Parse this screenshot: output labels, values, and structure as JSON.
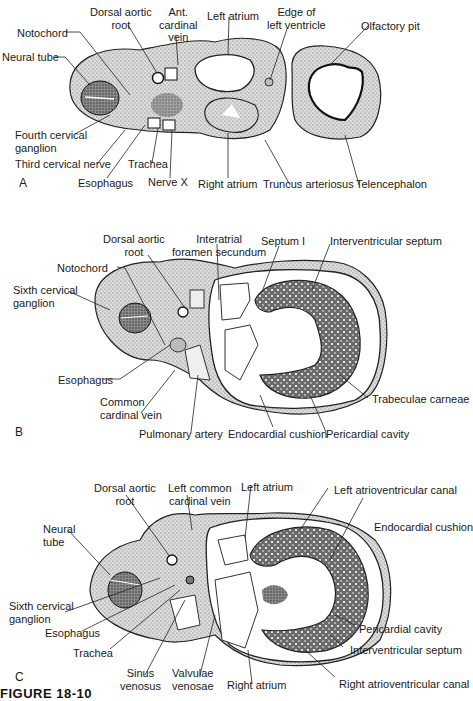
{
  "figure": {
    "caption": "FIGURE 18-10",
    "panels": [
      {
        "letter": "A",
        "labels": {
          "notochord": "Notochord",
          "neural_tube": "Neural tube",
          "dorsal_aortic_root": [
            "Dorsal aortic",
            "root"
          ],
          "ant_cardinal_vein": [
            "Ant.",
            "cardinal",
            "vein"
          ],
          "left_atrium": "Left atrium",
          "edge_left_ventricle": [
            "Edge of",
            "left ventricle"
          ],
          "olfactory_pit": "Olfactory pit",
          "fourth_cervical_ganglion": [
            "Fourth cervical",
            "ganglion"
          ],
          "third_cervical_nerve": "Third cervical nerve",
          "trachea": "Trachea",
          "esophagus": "Esophagus",
          "nerve_x": "Nerve X",
          "right_atrium": "Right atrium",
          "truncus_arteriosus": "Truncus arteriosus",
          "telencephalon": "Telencephalon"
        }
      },
      {
        "letter": "B",
        "labels": {
          "dorsal_aortic_root": [
            "Dorsal aortic",
            "root"
          ],
          "interatrial_foramen": [
            "Interatrial",
            "foramen secundum"
          ],
          "septum_i": "Septum I",
          "interventricular_septum": "Interventricular septum",
          "notochord": "Notochord",
          "sixth_cervical_ganglion": [
            "Sixth cervical",
            "ganglion"
          ],
          "esophagus": "Esophagus",
          "common_cardinal_vein": [
            "Common",
            "cardinal vein"
          ],
          "trabeculae_carneae": "Trabeculae carneae",
          "pulmonary_artery": "Pulmonary artery",
          "endocardial_cushion": "Endocardial cushion",
          "pericardial_cavity": "Pericardial cavity"
        }
      },
      {
        "letter": "C",
        "labels": {
          "dorsal_aortic_root": [
            "Dorsal aortic",
            "root"
          ],
          "left_common_cardinal_vein": [
            "Left common",
            "cardinal vein"
          ],
          "left_atrium": "Left atrium",
          "left_av_canal": "Left atrioventricular canal",
          "neural_tube": [
            "Neural",
            "tube"
          ],
          "endocardial_cushion": "Endocardial cushion",
          "sixth_cervical_ganglion": [
            "Sixth cervical",
            "ganglion"
          ],
          "esophagus": "Esophagus",
          "pericardial_cavity": "Pericardial cavity",
          "trachea": "Trachea",
          "interventricular_septum": "Interventricular septum",
          "sinus_venosus": [
            "Sinus",
            "venosus"
          ],
          "valvulae_venosae": [
            "Valvulae",
            "venosae"
          ],
          "right_atrium": "Right atrium",
          "right_av_canal": "Right atrioventricular canal"
        }
      }
    ]
  },
  "colors": {
    "ink": "#1a1a1a",
    "tissue_light": "#c9c9c9",
    "tissue_mid": "#9a9a9a",
    "tissue_dark": "#4a4a4a",
    "background": "#ffffff"
  }
}
